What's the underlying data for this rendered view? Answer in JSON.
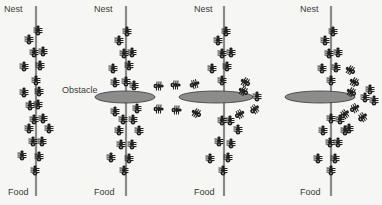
{
  "colors": {
    "background": "#f6f6f4",
    "trail": "#8a8a8a",
    "obstacle_fill": "#8c8c8c",
    "obstacle_stroke": "#333333",
    "ant": "#1e1e1e",
    "text": "#3a3a3a"
  },
  "labels": {
    "nest": "Nest",
    "food": "Food",
    "obstacle": "Obstacle"
  },
  "panels": [
    {
      "id": "panel-1",
      "line_x": 36,
      "nest_label_x": 4,
      "food_label_x": 8,
      "obstacle": null,
      "ants": [
        [
          38,
          30,
          0
        ],
        [
          29,
          39,
          0
        ],
        [
          34,
          52,
          0
        ],
        [
          43,
          51,
          0
        ],
        [
          24,
          66,
          0
        ],
        [
          40,
          65,
          0
        ],
        [
          36,
          80,
          0
        ],
        [
          24,
          92,
          0
        ],
        [
          39,
          91,
          0
        ],
        [
          30,
          105,
          0
        ],
        [
          38,
          104,
          0
        ],
        [
          34,
          119,
          0
        ],
        [
          43,
          118,
          0
        ],
        [
          29,
          128,
          0
        ],
        [
          49,
          128,
          0
        ],
        [
          33,
          141,
          0
        ],
        [
          42,
          141,
          0
        ],
        [
          22,
          155,
          0
        ],
        [
          39,
          156,
          0
        ],
        [
          35,
          170,
          0
        ]
      ]
    },
    {
      "id": "panel-2",
      "line_x": 126,
      "nest_label_x": 94,
      "food_label_x": 94,
      "obstacle": {
        "cx": 125,
        "cy": 97,
        "rx": 30,
        "ry": 6
      },
      "obstacle_label_x": 62,
      "obstacle_label_y": 86,
      "ants": [
        [
          127,
          31,
          0
        ],
        [
          119,
          40,
          0
        ],
        [
          124,
          53,
          0
        ],
        [
          132,
          52,
          0
        ],
        [
          113,
          68,
          0
        ],
        [
          129,
          65,
          0
        ],
        [
          115,
          82,
          0
        ],
        [
          126,
          81,
          0
        ],
        [
          134,
          85,
          0
        ],
        [
          115,
          111,
          0
        ],
        [
          137,
          108,
          0
        ],
        [
          123,
          119,
          0
        ],
        [
          133,
          119,
          0
        ],
        [
          119,
          130,
          0
        ],
        [
          139,
          130,
          0
        ],
        [
          121,
          144,
          0
        ],
        [
          132,
          144,
          0
        ],
        [
          111,
          157,
          0
        ],
        [
          129,
          158,
          0
        ],
        [
          124,
          170,
          0
        ]
      ]
    },
    {
      "id": "panel-3",
      "line_x": 224,
      "nest_label_x": 194,
      "food_label_x": 194,
      "obstacle": {
        "cx": 216,
        "cy": 97,
        "rx": 37,
        "ry": 6
      },
      "ants": [
        [
          226,
          31,
          0
        ],
        [
          218,
          40,
          0
        ],
        [
          222,
          53,
          0
        ],
        [
          231,
          52,
          0
        ],
        [
          212,
          68,
          0
        ],
        [
          227,
          66,
          0
        ],
        [
          222,
          80,
          0
        ],
        [
          159,
          86,
          90
        ],
        [
          176,
          85,
          90
        ],
        [
          195,
          84,
          70
        ],
        [
          245,
          82,
          -60
        ],
        [
          243,
          91,
          -60
        ],
        [
          257,
          96,
          0
        ],
        [
          159,
          109,
          90
        ],
        [
          177,
          110,
          90
        ],
        [
          196,
          113,
          -60
        ],
        [
          240,
          114,
          60
        ],
        [
          255,
          109,
          50
        ],
        [
          222,
          120,
          0
        ],
        [
          230,
          120,
          0
        ],
        [
          238,
          129,
          0
        ],
        [
          219,
          141,
          0
        ],
        [
          231,
          143,
          0
        ],
        [
          210,
          158,
          0
        ],
        [
          228,
          157,
          0
        ],
        [
          223,
          170,
          0
        ]
      ]
    },
    {
      "id": "panel-4",
      "line_x": 331,
      "nest_label_x": 300,
      "food_label_x": 300,
      "obstacle": {
        "cx": 320,
        "cy": 97,
        "rx": 35,
        "ry": 6
      },
      "ants": [
        [
          333,
          31,
          0
        ],
        [
          325,
          40,
          0
        ],
        [
          329,
          53,
          0
        ],
        [
          338,
          52,
          0
        ],
        [
          322,
          68,
          0
        ],
        [
          336,
          67,
          0
        ],
        [
          331,
          80,
          0
        ],
        [
          350,
          70,
          -60
        ],
        [
          354,
          82,
          -60
        ],
        [
          351,
          92,
          -60
        ],
        [
          370,
          89,
          0
        ],
        [
          365,
          97,
          0
        ],
        [
          374,
          100,
          0
        ],
        [
          355,
          108,
          60
        ],
        [
          345,
          114,
          50
        ],
        [
          363,
          117,
          50
        ],
        [
          331,
          118,
          0
        ],
        [
          340,
          119,
          0
        ],
        [
          349,
          128,
          0
        ],
        [
          323,
          130,
          0
        ],
        [
          345,
          130,
          0
        ],
        [
          330,
          142,
          0
        ],
        [
          338,
          142,
          0
        ],
        [
          318,
          158,
          0
        ],
        [
          335,
          158,
          0
        ],
        [
          331,
          170,
          0
        ]
      ]
    }
  ]
}
